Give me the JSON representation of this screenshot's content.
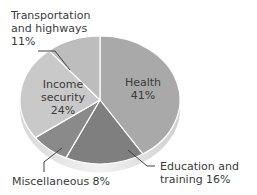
{
  "chart_data": {
    "type": "pie",
    "title": "",
    "style": "3d-tilted",
    "slices": [
      {
        "label": "Health",
        "value": 41,
        "color": "#a9a9a9",
        "label_text": "Health",
        "pct_text": "41%"
      },
      {
        "label": "Education and training",
        "value": 16,
        "color": "#7f7f7f",
        "label_text": "Education and training 16%"
      },
      {
        "label": "Miscellaneous",
        "value": 8,
        "color": "#8a8a8a",
        "label_text": "Miscellaneous 8%"
      },
      {
        "label": "Income security",
        "value": 24,
        "color": "#c9c9c9",
        "label_text": "Income security",
        "pct_text": "24%"
      },
      {
        "label": "Transportation and highways",
        "value": 11,
        "color": "#bdbdbd",
        "label_text": "Transportation and highways 11%"
      }
    ]
  },
  "labels": {
    "health_name": "Health",
    "health_pct": "41%",
    "income_line1": "Income",
    "income_line2": "security",
    "income_pct": "24%",
    "transport_line1": "Transportation",
    "transport_line2": "and highways",
    "transport_pct": "11%",
    "education_line1": "Education and",
    "education_line2": "training 16%",
    "misc": "Miscellaneous 8%"
  }
}
